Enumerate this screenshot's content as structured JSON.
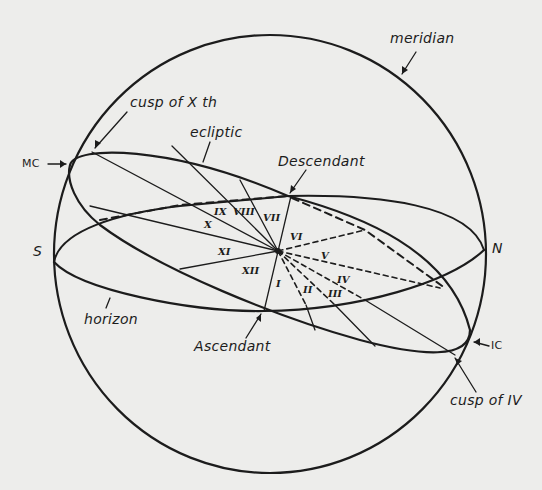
{
  "diagram": {
    "colors": {
      "ink": "#1c1c1c",
      "paper": "#ededeb"
    },
    "labels": {
      "meridian": "meridian",
      "cusp_x": "cusp of X th",
      "ecliptic": "ecliptic",
      "mc": "MC",
      "descendant": "Descendant",
      "s": "S",
      "n": "N",
      "horizon": "horizon",
      "ascendant": "Ascendant",
      "ic": "IC",
      "cusp_iv": "cusp of IV"
    },
    "houses": {
      "h1": "I",
      "h2": "II",
      "h3": "III",
      "h4": "IV",
      "h5": "V",
      "h6": "VI",
      "h7": "VII",
      "h8": "VIII",
      "h9": "IX",
      "h10": "X",
      "h11": "XI",
      "h12": "XII"
    }
  }
}
